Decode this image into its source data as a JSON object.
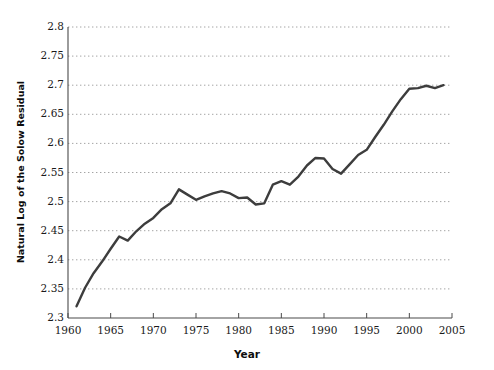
{
  "chart_data": {
    "type": "line",
    "title": "",
    "xlabel": "Year",
    "ylabel": "Natural Log of the Solow Residual",
    "xlim": [
      1960,
      2005
    ],
    "ylim": [
      2.3,
      2.8
    ],
    "grid": true,
    "grid_axis": "y",
    "legend": "none",
    "line_color": "#3d3d3d",
    "grid_color": "#9a9a9a",
    "axis_color": "#4a4a4a",
    "xticks": [
      1960,
      1965,
      1970,
      1975,
      1980,
      1985,
      1990,
      1995,
      2000,
      2005
    ],
    "xtick_labels": [
      "1960",
      "1965",
      "1970",
      "1975",
      "1980",
      "1985",
      "1990",
      "1995",
      "2000",
      "2005"
    ],
    "yticks": [
      2.3,
      2.35,
      2.4,
      2.45,
      2.5,
      2.55,
      2.6,
      2.65,
      2.7,
      2.75,
      2.8
    ],
    "ytick_labels": [
      "2.3",
      "2.35",
      "2.4",
      "2.45",
      "2.5",
      "2.55",
      "2.6",
      "2.65",
      "2.7",
      "2.75",
      "2.8"
    ],
    "series": [
      {
        "name": "Natural Log of the Solow Residual",
        "x": [
          1961,
          1962,
          1963,
          1964,
          1965,
          1966,
          1967,
          1968,
          1969,
          1970,
          1971,
          1972,
          1973,
          1974,
          1975,
          1976,
          1977,
          1978,
          1979,
          1980,
          1981,
          1982,
          1983,
          1984,
          1985,
          1986,
          1987,
          1988,
          1989,
          1990,
          1991,
          1992,
          1993,
          1994,
          1995,
          1996,
          1997,
          1998,
          1999,
          2000,
          2001,
          2002,
          2003,
          2004
        ],
        "values": [
          2.32,
          2.352,
          2.377,
          2.397,
          2.419,
          2.44,
          2.433,
          2.449,
          2.462,
          2.472,
          2.487,
          2.497,
          2.521,
          2.512,
          2.503,
          2.509,
          2.514,
          2.518,
          2.514,
          2.506,
          2.507,
          2.495,
          2.497,
          2.529,
          2.535,
          2.529,
          2.543,
          2.562,
          2.575,
          2.574,
          2.556,
          2.548,
          2.564,
          2.58,
          2.589,
          2.611,
          2.632,
          2.655,
          2.676,
          2.694,
          2.695,
          2.699,
          2.695,
          2.7
        ]
      }
    ]
  }
}
